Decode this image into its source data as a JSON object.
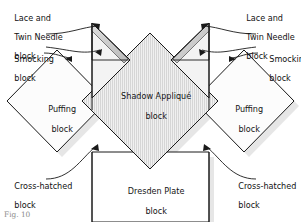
{
  "figure": {
    "caption": "Fig. 10",
    "width": 301,
    "height": 222,
    "background_color": "#ffffff",
    "line_color": "#1a1a1a",
    "fill_light": "#fbfbfb",
    "fill_hatched": "#e2e2e2",
    "shadow_color": "#c9c9c9"
  },
  "blocks": {
    "center": {
      "label_line1": "Shadow Appliqué",
      "label_line2": "block",
      "name": "shadow-applique-block"
    },
    "left_diamond": {
      "label_line1": "Puffing",
      "label_line2": "block",
      "name": "puffing-block-left"
    },
    "right_diamond": {
      "label_line1": "Puffing",
      "label_line2": "block",
      "name": "puffing-block-right"
    },
    "bottom": {
      "label_line1": "Dresden Plate",
      "label_line2": "block",
      "name": "dresden-plate-block"
    }
  },
  "callouts": {
    "lace_left": {
      "line1": "Lace and",
      "line2": "Twin Needle",
      "line3": "block"
    },
    "lace_right": {
      "line1": "Lace and",
      "line2": "Twin Needle",
      "line3": "block"
    },
    "smocking_left": {
      "line1": "Smocking",
      "line2": "block"
    },
    "smocking_right": {
      "line1": "Smocking",
      "line2": "block"
    },
    "crosshatched_left": {
      "line1": "Cross-hatched",
      "line2": "block"
    },
    "crosshatched_right": {
      "line1": "Cross-hatched",
      "line2": "block"
    }
  }
}
